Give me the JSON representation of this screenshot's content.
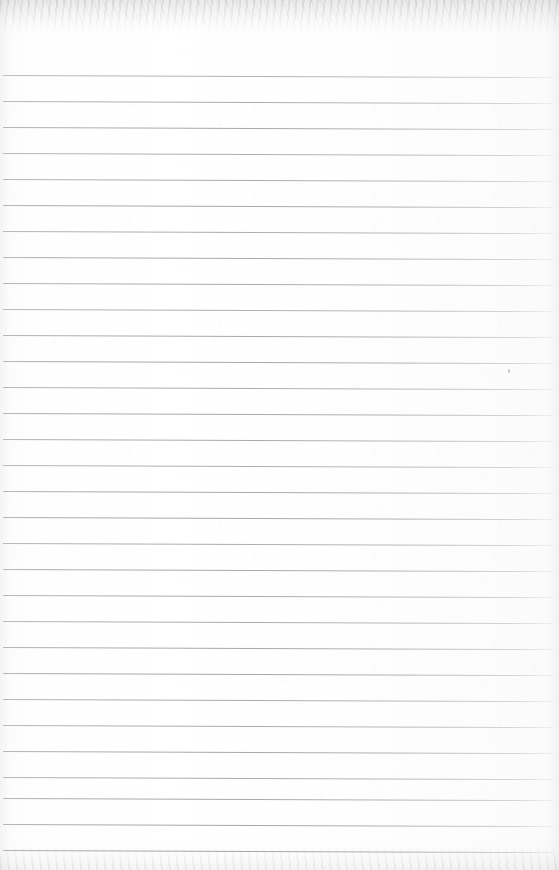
{
  "document": {
    "kind": "scanned-page",
    "subject": "blank ruled notepad sheet",
    "content_text": "",
    "width": 559,
    "height": 870
  },
  "paper": {
    "background_color": "#fdfdfd",
    "edge_shadow_color": "#9a9aa2",
    "has_top_edge_band": true,
    "has_bottom_edge_band": true,
    "texture": "faint scanner mottling"
  },
  "ruling": {
    "line_color": "#9a9aa2",
    "line_thickness_px": 1,
    "first_line_y": 75,
    "line_spacing_px": 26,
    "line_count": 31,
    "line_start_x": 3,
    "line_end_x": 553,
    "tilt_degrees": 0.22,
    "margin_rule_visible": false,
    "lines": [
      {
        "index": 1,
        "y": 75,
        "opacity": 0.8
      },
      {
        "index": 2,
        "y": 101,
        "opacity": 0.86
      },
      {
        "index": 3,
        "y": 127,
        "opacity": 0.9
      },
      {
        "index": 4,
        "y": 153,
        "opacity": 0.84
      },
      {
        "index": 5,
        "y": 179,
        "opacity": 0.88
      },
      {
        "index": 6,
        "y": 205,
        "opacity": 0.92
      },
      {
        "index": 7,
        "y": 231,
        "opacity": 0.86
      },
      {
        "index": 8,
        "y": 257,
        "opacity": 0.9
      },
      {
        "index": 9,
        "y": 283,
        "opacity": 0.88
      },
      {
        "index": 10,
        "y": 309,
        "opacity": 0.84
      },
      {
        "index": 11,
        "y": 335,
        "opacity": 0.9
      },
      {
        "index": 12,
        "y": 361,
        "opacity": 0.92
      },
      {
        "index": 13,
        "y": 387,
        "opacity": 0.86
      },
      {
        "index": 14,
        "y": 413,
        "opacity": 0.9
      },
      {
        "index": 15,
        "y": 439,
        "opacity": 0.88
      },
      {
        "index": 16,
        "y": 465,
        "opacity": 0.84
      },
      {
        "index": 17,
        "y": 491,
        "opacity": 0.9
      },
      {
        "index": 18,
        "y": 517,
        "opacity": 0.92
      },
      {
        "index": 19,
        "y": 543,
        "opacity": 0.86
      },
      {
        "index": 20,
        "y": 569,
        "opacity": 0.9
      },
      {
        "index": 21,
        "y": 595,
        "opacity": 0.88
      },
      {
        "index": 22,
        "y": 621,
        "opacity": 0.86
      },
      {
        "index": 23,
        "y": 647,
        "opacity": 0.9
      },
      {
        "index": 24,
        "y": 673,
        "opacity": 0.92
      },
      {
        "index": 25,
        "y": 699,
        "opacity": 0.88
      },
      {
        "index": 26,
        "y": 725,
        "opacity": 0.86
      },
      {
        "index": 27,
        "y": 751,
        "opacity": 0.9
      },
      {
        "index": 28,
        "y": 777,
        "opacity": 0.88
      },
      {
        "index": 29,
        "y": 798,
        "opacity": 0.9
      },
      {
        "index": 30,
        "y": 824,
        "opacity": 0.92
      },
      {
        "index": 31,
        "y": 850,
        "opacity": 0.94
      }
    ]
  },
  "marks": [
    {
      "name": "paper-speck",
      "x": 508,
      "y": 369
    }
  ]
}
